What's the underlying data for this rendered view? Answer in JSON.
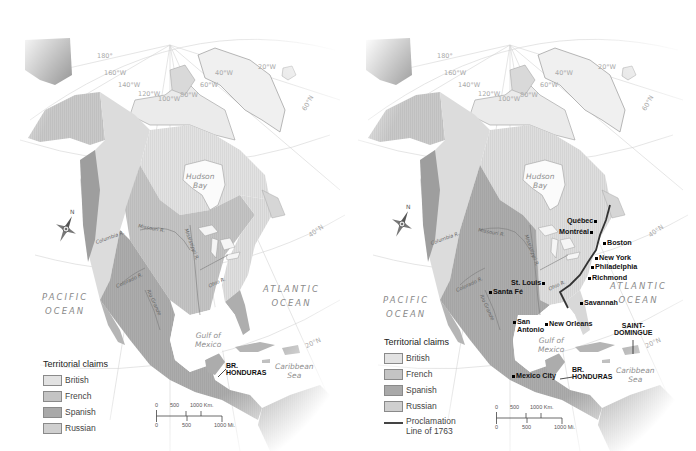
{
  "maps": [
    {
      "id": "before-1763",
      "legend": {
        "title": "Territorial claims",
        "items": [
          {
            "label": "British",
            "color": "#e2e2e2"
          },
          {
            "label": "French",
            "color": "#c4c4c4"
          },
          {
            "label": "Spanish",
            "color": "#a9a9a9"
          },
          {
            "label": "Russian",
            "color": "#cfcfcf"
          }
        ]
      },
      "oceans": {
        "pacific_line1": "PACIFIC",
        "pacific_line2": "OCEAN",
        "atlantic_line1": "ATLANTIC",
        "atlantic_line2": "OCEAN",
        "hudson_line1": "Hudson",
        "hudson_line2": "Bay",
        "gulf_line1": "Gulf of",
        "gulf_line2": "Mexico",
        "caribbean_line1": "Caribbean",
        "caribbean_line2": "Sea"
      },
      "graticule": {
        "lon_180": "180°",
        "lon_160": "160°W",
        "lon_140": "140°W",
        "lon_120": "120°W",
        "lon_100": "100°W",
        "lon_80": "80°W",
        "lon_60": "60°W",
        "lon_40": "40°W",
        "lon_20": "20°W",
        "lat_60": "60°N",
        "lat_40": "40°N",
        "lat_20": "20°N"
      },
      "rivers": {
        "columbia": "Columbia R.",
        "missouri": "Missouri R.",
        "mississippi": "Mississippi R.",
        "ohio": "Ohio R.",
        "colorado": "Colorado R.",
        "rio_grande": "Rio Grande"
      },
      "regions": {
        "br_honduras_line1": "BR.",
        "br_honduras_line2": "HONDURAS"
      },
      "compass": {
        "north_label": "N"
      },
      "scale": {
        "km_ticks": [
          "0",
          "500",
          "1000 Km."
        ],
        "mi_ticks": [
          "0",
          "500",
          "1000 Mi."
        ]
      }
    },
    {
      "id": "after-1763",
      "legend": {
        "title": "Territorial claims",
        "items": [
          {
            "label": "British",
            "color": "#e2e2e2"
          },
          {
            "label": "French",
            "color": "#c4c4c4"
          },
          {
            "label": "Spanish",
            "color": "#a9a9a9"
          },
          {
            "label": "Russian",
            "color": "#cfcfcf"
          }
        ],
        "line_item_line1": "Proclamation",
        "line_item_line2": "Line of 1763"
      },
      "oceans": {
        "pacific_line1": "PACIFIC",
        "pacific_line2": "OCEAN",
        "atlantic_line1": "ATLANTIC",
        "atlantic_line2": "OCEAN",
        "hudson_line1": "Hudson",
        "hudson_line2": "Bay",
        "gulf_line1": "Gulf of",
        "gulf_line2": "Mexico",
        "caribbean_line1": "Caribbean",
        "caribbean_line2": "Sea"
      },
      "graticule": {
        "lon_180": "180°",
        "lon_160": "160°W",
        "lon_140": "140°W",
        "lon_120": "120°W",
        "lon_100": "100°W",
        "lon_80": "80°W",
        "lon_60": "60°W",
        "lon_40": "40°W",
        "lon_20": "20°W",
        "lat_60": "60°N",
        "lat_40": "40°N",
        "lat_20": "20°N"
      },
      "rivers": {
        "columbia": "Columbia R.",
        "missouri": "Missouri R.",
        "mississippi": "Mississippi R.",
        "ohio": "Ohio R.",
        "colorado": "Colorado R.",
        "rio_grande": "Rio Grande"
      },
      "cities": {
        "quebec": "Québec",
        "montreal": "Montréal",
        "boston": "Boston",
        "new_york": "New York",
        "philadelphia": "Philadelphia",
        "richmond": "Richmond",
        "savannah": "Savannah",
        "st_louis": "St. Louis",
        "santa_fe": "Santa Fé",
        "san_antonio_line1": "San",
        "san_antonio_line2": "Antonio",
        "new_orleans": "New Orleans",
        "mexico_city": "Mexico City"
      },
      "regions": {
        "saint_domingue_line1": "SAINT-",
        "saint_domingue_line2": "DOMINGUE",
        "br_honduras_line1": "BR.",
        "br_honduras_line2": "HONDURAS"
      },
      "compass": {
        "north_label": "N"
      },
      "scale": {
        "km_ticks": [
          "0",
          "500",
          "1000 Km."
        ],
        "mi_ticks": [
          "0",
          "500",
          "1000 Mi."
        ]
      }
    }
  ]
}
